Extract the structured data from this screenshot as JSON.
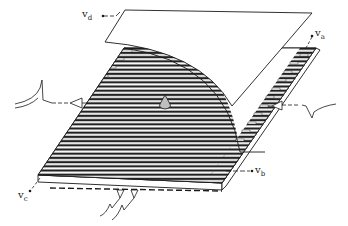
{
  "figure": {
    "colors": {
      "line": "#1a1a1a",
      "background": "#ffffff",
      "stripe_light": "#ffffff",
      "stripe_dark": "#222222",
      "droplet": "#bfbfbf"
    }
  },
  "labels": {
    "vd": {
      "main": "v",
      "sub": "d"
    },
    "va": {
      "main": "v",
      "sub": "a"
    },
    "vb": {
      "main": "v",
      "sub": "b"
    },
    "vc": {
      "main": "v",
      "sub": "c"
    }
  },
  "signals": {
    "left": "spike-pulse-left",
    "right": "dip-pulse-right",
    "bottom": "double-spike-bottom"
  }
}
